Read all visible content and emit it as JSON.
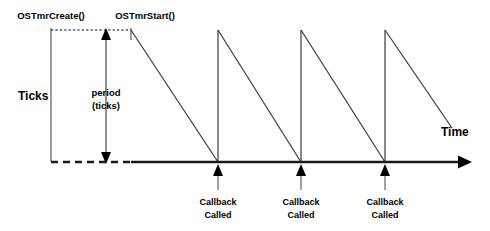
{
  "diagram": {
    "type": "timing-diagram",
    "title_visible": false,
    "background_color": "#ffffff",
    "line_color": "#000000",
    "axes": {
      "y_label": "Ticks",
      "x_label": "Time",
      "baseline_y": 162,
      "origin_x": 51,
      "x_axis_end": 468,
      "top_level_y": 30
    },
    "events": [
      {
        "id": "create",
        "label": "OSTmrCreate()",
        "x": 51
      },
      {
        "id": "start",
        "label": "OSTmrStart()",
        "x": 131
      }
    ],
    "period_annotation": {
      "line1": "period",
      "line2": "(ticks)",
      "x": 106,
      "from_y": 30,
      "to_y": 162,
      "arrow_both_ends": true
    },
    "callbacks": [
      {
        "line1": "Callback",
        "line2": "Called",
        "x": 218
      },
      {
        "line1": "Callback",
        "line2": "Called",
        "x": 301
      },
      {
        "line1": "Callback",
        "line2": "Called",
        "x": 385
      }
    ],
    "sawtooth": {
      "description": "Counter ramps down from period value to zero, reloading at each callback",
      "peak_y": 30,
      "baseline_y": 162,
      "segments": [
        {
          "rise_x": 131,
          "fall_to_x": 218
        },
        {
          "rise_x": 218,
          "fall_to_x": 301
        },
        {
          "rise_x": 301,
          "fall_to_x": 385
        },
        {
          "rise_x": 385,
          "fall_to_x": 452,
          "truncated": true,
          "truncated_y": 128
        }
      ]
    },
    "dotted_guide": {
      "from_x": 51,
      "to_x": 131,
      "y": 30
    },
    "dashed_baseline": {
      "from_x": 51,
      "to_x": 131
    }
  }
}
